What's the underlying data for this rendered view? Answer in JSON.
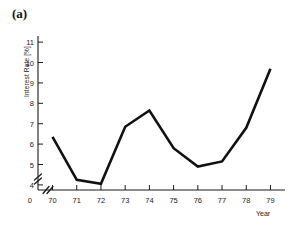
{
  "figure": {
    "caption": "(a)"
  },
  "chart_data": {
    "type": "line",
    "title": "",
    "xlabel": "Year",
    "ylabel": "Interest Rate [%]",
    "x": [
      70,
      71,
      72,
      73,
      74,
      75,
      76,
      77,
      78,
      79
    ],
    "categories": [
      "70",
      "71",
      "72",
      "73",
      "74",
      "75",
      "76",
      "77",
      "78",
      "79"
    ],
    "values": [
      6.35,
      4.25,
      4.05,
      6.85,
      7.65,
      5.8,
      4.9,
      5.15,
      6.8,
      9.7
    ],
    "series": [
      {
        "name": "Interest Rate",
        "values": [
          6.35,
          4.25,
          4.05,
          6.85,
          7.65,
          5.8,
          4.9,
          5.15,
          6.8,
          9.7
        ]
      }
    ],
    "xlim": [
      69.4,
      79.6
    ],
    "ylim": [
      3.75,
      11.3
    ],
    "y_ticks": [
      4,
      5,
      6,
      7,
      8,
      9,
      10,
      11
    ],
    "y_tick_labels": [
      "4",
      "5",
      "6",
      "7",
      "8",
      "9",
      "10",
      "11"
    ],
    "x_ticks": [
      70,
      71,
      72,
      73,
      74,
      75,
      76,
      77,
      78,
      79
    ],
    "x_tick_labels": [
      "70",
      "71",
      "72",
      "73",
      "74",
      "75",
      "76",
      "77",
      "78",
      "79"
    ],
    "origin_label": "0",
    "axis_break": true,
    "grid": false,
    "legend": false,
    "legend_position": "none",
    "line_color": "#111111"
  }
}
